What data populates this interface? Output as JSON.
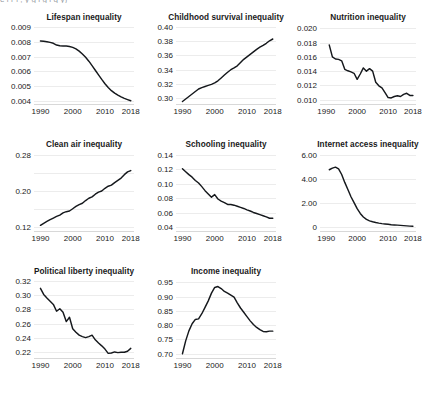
{
  "figure": {
    "cropped_top_caption": "e  i  r  i ,  y  g  l  g l     q   y)",
    "x_ticks": [
      1990,
      2000,
      2010,
      2018
    ],
    "x_range": [
      1988,
      2019
    ],
    "line_color": "#15181c",
    "gridline_color": "#ececec",
    "text_color": "#1a1a1a",
    "background": "#ffffff"
  },
  "chart_data": [
    {
      "type": "line",
      "title": "Lifespan inequality",
      "xlabel": "",
      "ylabel": "",
      "grid": true,
      "legend": "none",
      "xlim": [
        1988,
        2019
      ],
      "ylim": [
        0.0038,
        0.0092
      ],
      "yticks": [
        0.004,
        0.005,
        0.006,
        0.007,
        0.008,
        0.009
      ],
      "ytick_labels": [
        "0.004",
        "0.005",
        "0.006",
        "0.007",
        "0.008",
        "0.009"
      ],
      "xticks": [
        1990,
        2000,
        2010,
        2018
      ],
      "x": [
        1990,
        1991,
        1992,
        1993,
        1994,
        1995,
        1996,
        1997,
        1998,
        1999,
        2000,
        2001,
        2002,
        2003,
        2004,
        2005,
        2006,
        2007,
        2008,
        2009,
        2010,
        2011,
        2012,
        2013,
        2014,
        2015,
        2016,
        2017,
        2018
      ],
      "values": [
        0.00805,
        0.00803,
        0.008,
        0.00796,
        0.0079,
        0.00778,
        0.00773,
        0.00772,
        0.00771,
        0.00768,
        0.00762,
        0.00752,
        0.00737,
        0.00718,
        0.00696,
        0.00669,
        0.00639,
        0.00608,
        0.00577,
        0.00546,
        0.00517,
        0.00491,
        0.0047,
        0.00453,
        0.0044,
        0.00428,
        0.00418,
        0.0041,
        0.00402
      ]
    },
    {
      "type": "line",
      "title": "Childhood survival inequality",
      "xlabel": "",
      "ylabel": "",
      "grid": true,
      "legend": "none",
      "xlim": [
        1988,
        2019
      ],
      "ylim": [
        0.292,
        0.404
      ],
      "yticks": [
        0.3,
        0.32,
        0.34,
        0.36,
        0.38,
        0.4
      ],
      "ytick_labels": [
        "0.30",
        "0.32",
        "0.34",
        "0.36",
        "0.38",
        "0.40"
      ],
      "xticks": [
        1990,
        2000,
        2010,
        2018
      ],
      "x": [
        1990,
        1991,
        1992,
        1993,
        1994,
        1995,
        1996,
        1997,
        1998,
        1999,
        2000,
        2001,
        2002,
        2003,
        2004,
        2005,
        2006,
        2007,
        2008,
        2009,
        2010,
        2011,
        2012,
        2013,
        2014,
        2015,
        2016,
        2017,
        2018
      ],
      "values": [
        0.2955,
        0.299,
        0.3025,
        0.306,
        0.3095,
        0.313,
        0.315,
        0.3165,
        0.318,
        0.3195,
        0.3215,
        0.3245,
        0.3285,
        0.3325,
        0.3365,
        0.34,
        0.3425,
        0.3455,
        0.35,
        0.3545,
        0.358,
        0.3615,
        0.365,
        0.3685,
        0.3715,
        0.374,
        0.377,
        0.3805,
        0.383
      ]
    },
    {
      "type": "line",
      "title": "Nutrition inequality",
      "xlabel": "",
      "ylabel": "",
      "grid": true,
      "legend": "none",
      "xlim": [
        1988,
        2019
      ],
      "ylim": [
        0.0094,
        0.0206
      ],
      "yticks": [
        0.01,
        0.012,
        0.014,
        0.016,
        0.018,
        0.02
      ],
      "ytick_labels": [
        "0.010",
        "0.012",
        "0.014",
        "0.016",
        "0.018",
        "0.020"
      ],
      "xticks": [
        1990,
        2000,
        2010,
        2018
      ],
      "x": [
        1991,
        1992,
        1993,
        1994,
        1995,
        1996,
        1997,
        1998,
        1999,
        2000,
        2001,
        2002,
        2003,
        2004,
        2005,
        2006,
        2007,
        2008,
        2009,
        2010,
        2011,
        2012,
        2013,
        2014,
        2015,
        2016,
        2017,
        2018
      ],
      "values": [
        0.01765,
        0.016,
        0.0157,
        0.01565,
        0.01545,
        0.01425,
        0.01405,
        0.0139,
        0.0137,
        0.01285,
        0.0136,
        0.01445,
        0.014,
        0.01435,
        0.014,
        0.01245,
        0.01195,
        0.01165,
        0.011,
        0.0103,
        0.01025,
        0.01045,
        0.01055,
        0.01045,
        0.01075,
        0.0109,
        0.0106,
        0.0106
      ]
    },
    {
      "type": "line",
      "title": "Clean air inequality",
      "xlabel": "",
      "ylabel": "",
      "grid": true,
      "legend": "none",
      "xlim": [
        1988,
        2019
      ],
      "ylim": [
        0.112,
        0.288
      ],
      "yticks": [
        0.12,
        0.16,
        0.2,
        0.24,
        0.28
      ],
      "ytick_labels": [
        "0.12",
        "",
        "0.20",
        "",
        "0.28"
      ],
      "xticks": [
        1990,
        2000,
        2010,
        2018
      ],
      "x": [
        1990,
        1991,
        1992,
        1993,
        1994,
        1995,
        1996,
        1997,
        1998,
        1999,
        2000,
        2001,
        2002,
        2003,
        2004,
        2005,
        2006,
        2007,
        2008,
        2009,
        2010,
        2011,
        2012,
        2013,
        2014,
        2015,
        2016,
        2017,
        2018
      ],
      "values": [
        0.1245,
        0.129,
        0.133,
        0.137,
        0.1405,
        0.144,
        0.147,
        0.152,
        0.1545,
        0.156,
        0.161,
        0.166,
        0.17,
        0.173,
        0.179,
        0.184,
        0.187,
        0.193,
        0.1975,
        0.2,
        0.206,
        0.2105,
        0.213,
        0.2185,
        0.2235,
        0.2285,
        0.236,
        0.242,
        0.245
      ]
    },
    {
      "type": "line",
      "title": "Schooling inequality",
      "xlabel": "",
      "ylabel": "",
      "grid": true,
      "legend": "none",
      "xlim": [
        1988,
        2019
      ],
      "ylim": [
        0.035,
        0.145
      ],
      "yticks": [
        0.04,
        0.06,
        0.08,
        0.1,
        0.12,
        0.14
      ],
      "ytick_labels": [
        "0.04",
        "0.06",
        "0.08",
        "0.10",
        "0.12",
        "0.14"
      ],
      "xticks": [
        1990,
        2000,
        2010,
        2018
      ],
      "x": [
        1990,
        1991,
        1992,
        1993,
        1994,
        1995,
        1996,
        1997,
        1998,
        1999,
        2000,
        2001,
        2002,
        2003,
        2004,
        2005,
        2006,
        2007,
        2008,
        2009,
        2010,
        2011,
        2012,
        2013,
        2014,
        2015,
        2016,
        2017,
        2018
      ],
      "values": [
        0.1205,
        0.1165,
        0.1125,
        0.109,
        0.1045,
        0.101,
        0.096,
        0.0905,
        0.086,
        0.0815,
        0.085,
        0.079,
        0.076,
        0.074,
        0.0715,
        0.0715,
        0.0705,
        0.069,
        0.0675,
        0.066,
        0.064,
        0.0625,
        0.0605,
        0.059,
        0.0575,
        0.056,
        0.0545,
        0.0525,
        0.0525
      ]
    },
    {
      "type": "line",
      "title": "Internet access inequality",
      "xlabel": "",
      "ylabel": "",
      "grid": true,
      "legend": "none",
      "xlim": [
        1988,
        2019
      ],
      "ylim": [
        -0.35,
        6.35
      ],
      "yticks": [
        0,
        2.0,
        4.0,
        6.0
      ],
      "ytick_labels": [
        "0",
        "2.00",
        "4.00",
        "6.00"
      ],
      "xticks": [
        1990,
        2000,
        2010,
        2018
      ],
      "x": [
        1991,
        1992,
        1993,
        1994,
        1995,
        1996,
        1997,
        1998,
        1999,
        2000,
        2001,
        2002,
        2003,
        2004,
        2005,
        2006,
        2007,
        2008,
        2009,
        2010,
        2011,
        2012,
        2013,
        2014,
        2015,
        2016,
        2017,
        2018
      ],
      "values": [
        4.78,
        4.92,
        5.0,
        4.86,
        4.38,
        3.72,
        3.12,
        2.52,
        2.02,
        1.52,
        1.12,
        0.82,
        0.62,
        0.5,
        0.42,
        0.36,
        0.31,
        0.27,
        0.24,
        0.21,
        0.18,
        0.16,
        0.14,
        0.12,
        0.1,
        0.08,
        0.06,
        0.05
      ]
    },
    {
      "type": "line",
      "title": "Political liberty inequality",
      "xlabel": "",
      "ylabel": "",
      "grid": true,
      "legend": "none",
      "xlim": [
        1988,
        2019
      ],
      "ylim": [
        0.212,
        0.324
      ],
      "yticks": [
        0.22,
        0.24,
        0.26,
        0.28,
        0.3,
        0.32
      ],
      "ytick_labels": [
        "0.22",
        "0.24",
        "0.26",
        "0.28",
        "0.30",
        "0.32"
      ],
      "xticks": [
        1990,
        2000,
        2010,
        2018
      ],
      "x": [
        1990,
        1991,
        1992,
        1993,
        1994,
        1995,
        1996,
        1997,
        1998,
        1999,
        2000,
        2001,
        2002,
        2003,
        2004,
        2005,
        2006,
        2007,
        2008,
        2009,
        2010,
        2011,
        2012,
        2013,
        2014,
        2015,
        2016,
        2017,
        2018
      ],
      "values": [
        0.3095,
        0.301,
        0.296,
        0.2915,
        0.287,
        0.2775,
        0.281,
        0.276,
        0.263,
        0.269,
        0.253,
        0.248,
        0.244,
        0.242,
        0.2405,
        0.242,
        0.244,
        0.2375,
        0.233,
        0.229,
        0.2245,
        0.2185,
        0.219,
        0.2205,
        0.2195,
        0.22,
        0.22,
        0.2215,
        0.2255
      ]
    },
    {
      "type": "line",
      "title": "Income inequality",
      "xlabel": "",
      "ylabel": "",
      "grid": true,
      "legend": "none",
      "xlim": [
        1988,
        2019
      ],
      "ylim": [
        0.685,
        0.965
      ],
      "yticks": [
        0.7,
        0.75,
        0.8,
        0.85,
        0.9,
        0.95
      ],
      "ytick_labels": [
        "0.70",
        "0.75",
        "0.80",
        "0.85",
        "0.90",
        "0.95"
      ],
      "xticks": [
        1990,
        2000,
        2010,
        2018
      ],
      "x": [
        1990,
        1991,
        1992,
        1993,
        1994,
        1995,
        1996,
        1997,
        1998,
        1999,
        2000,
        2001,
        2002,
        2003,
        2004,
        2005,
        2006,
        2007,
        2008,
        2009,
        2010,
        2011,
        2012,
        2013,
        2014,
        2015,
        2016,
        2017,
        2018
      ],
      "values": [
        0.7,
        0.745,
        0.78,
        0.805,
        0.82,
        0.822,
        0.84,
        0.862,
        0.885,
        0.912,
        0.932,
        0.935,
        0.928,
        0.918,
        0.912,
        0.905,
        0.898,
        0.878,
        0.86,
        0.845,
        0.83,
        0.815,
        0.802,
        0.792,
        0.784,
        0.778,
        0.777,
        0.779,
        0.779
      ]
    }
  ]
}
